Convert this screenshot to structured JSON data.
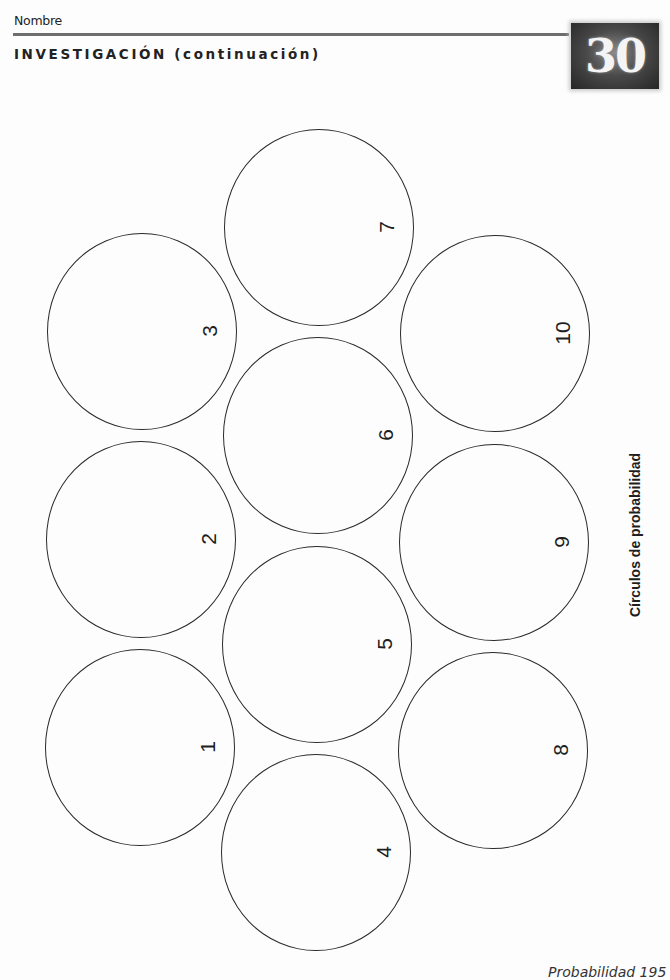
{
  "header": {
    "name_label": "Nombre",
    "section_title": "INVESTIGACIÓN (continuación)",
    "lesson_number": "30"
  },
  "diagram": {
    "side_label": "Círculos de probabilidad",
    "circles": [
      {
        "label": "1",
        "cx": 140,
        "cy": 747
      },
      {
        "label": "2",
        "cx": 141,
        "cy": 539
      },
      {
        "label": "3",
        "cx": 142,
        "cy": 331
      },
      {
        "label": "4",
        "cx": 316,
        "cy": 852
      },
      {
        "label": "5",
        "cx": 317,
        "cy": 644
      },
      {
        "label": "6",
        "cx": 318,
        "cy": 435
      },
      {
        "label": "7",
        "cx": 319,
        "cy": 227
      },
      {
        "label": "8",
        "cx": 493,
        "cy": 750
      },
      {
        "label": "9",
        "cx": 494,
        "cy": 542
      },
      {
        "label": "10",
        "cx": 495,
        "cy": 333
      }
    ]
  },
  "footer": {
    "text": "Probabilidad 195"
  }
}
